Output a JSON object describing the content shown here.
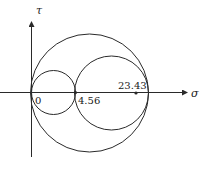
{
  "diagram": {
    "type": "mohr-circle",
    "axes": {
      "x_label": "σ",
      "y_label": "τ"
    },
    "points": [
      {
        "label": "0",
        "value": 0
      },
      {
        "label": "4.56",
        "value": 4.56
      },
      {
        "label": "23.43",
        "value": 23.43
      }
    ],
    "circles": [
      {
        "name": "small-circle",
        "from": 0,
        "to": 4.56
      },
      {
        "name": "middle-circle",
        "from": 4.56,
        "to_edge": true
      },
      {
        "name": "large-circle",
        "from": 0,
        "to_edge": true
      }
    ],
    "colors": {
      "line": "#2a2a2a",
      "background": "#ffffff"
    }
  }
}
